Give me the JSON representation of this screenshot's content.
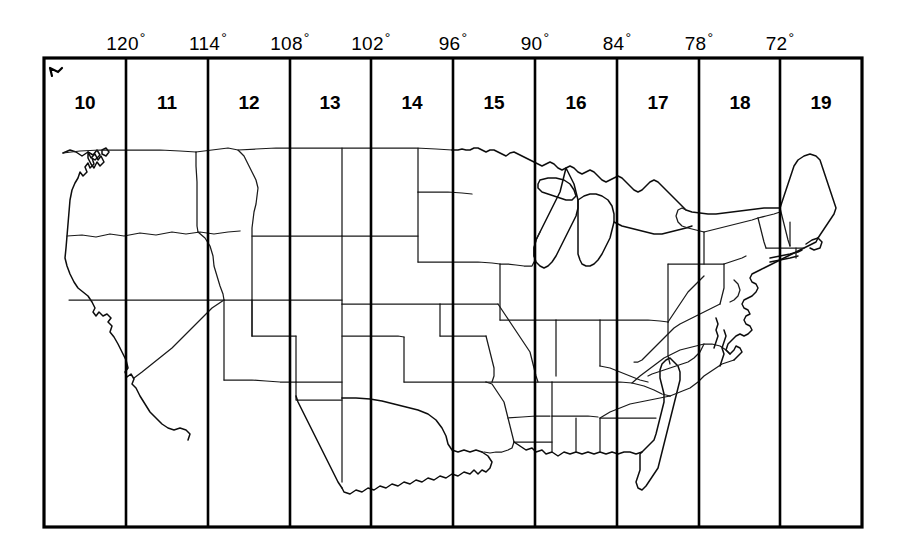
{
  "figure": {
    "type": "map",
    "frame": {
      "left": 44,
      "top": 58,
      "right": 862,
      "bottom": 527
    },
    "line_color": "#000000",
    "background_color": "#ffffff"
  },
  "axis": {
    "name": "longitude-axis",
    "position": "top",
    "unit": "degrees west",
    "degree_symbol": "°",
    "ticks": [
      {
        "label": "120",
        "degrees": 120,
        "x": 126
      },
      {
        "label": "114",
        "degrees": 114,
        "x": 208
      },
      {
        "label": "108",
        "degrees": 108,
        "x": 290
      },
      {
        "label": "102",
        "degrees": 102,
        "x": 371
      },
      {
        "label": "96",
        "degrees": 96,
        "x": 453
      },
      {
        "label": "90",
        "degrees": 90,
        "x": 535
      },
      {
        "label": "84",
        "degrees": 84,
        "x": 617
      },
      {
        "label": "78",
        "degrees": 78,
        "x": 699
      },
      {
        "label": "72",
        "degrees": 72,
        "x": 780
      }
    ]
  },
  "zones": [
    {
      "label": "10",
      "center_x": 85,
      "lon_range": "126°W–120°W"
    },
    {
      "label": "11",
      "center_x": 167,
      "lon_range": "120°W–114°W"
    },
    {
      "label": "12",
      "center_x": 249,
      "lon_range": "114°W–108°W"
    },
    {
      "label": "13",
      "center_x": 330,
      "lon_range": "108°W–102°W"
    },
    {
      "label": "14",
      "center_x": 412,
      "lon_range": "102°W–96°W"
    },
    {
      "label": "15",
      "center_x": 494,
      "lon_range": "96°W–90°W"
    },
    {
      "label": "16",
      "center_x": 576,
      "lon_range": "90°W–84°W"
    },
    {
      "label": "17",
      "center_x": 658,
      "lon_range": "84°W–78°W"
    },
    {
      "label": "18",
      "center_x": 740,
      "lon_range": "78°W–72°W"
    },
    {
      "label": "19",
      "center_x": 821,
      "lon_range": "72°W–66°W"
    }
  ],
  "zone_label_y": 93,
  "tick_label_y": 31,
  "gridline_x": [
    126,
    208,
    290,
    371,
    453,
    535,
    617,
    699,
    780
  ],
  "map": {
    "name": "contiguous-us-outline",
    "stroke": "#1a1a1a"
  }
}
